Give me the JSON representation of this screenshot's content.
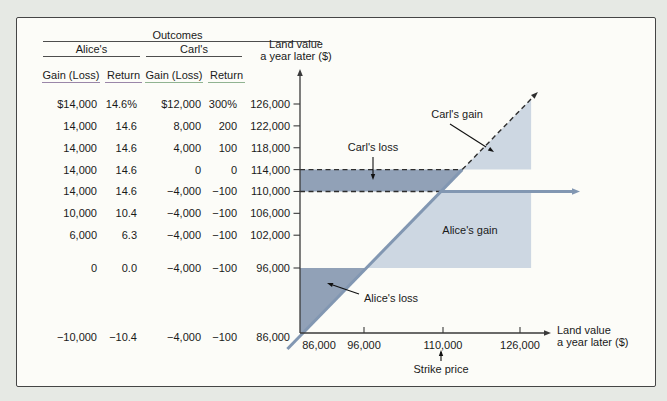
{
  "table": {
    "title": "Outcomes",
    "group_headers": [
      "Alice's",
      "Carl's"
    ],
    "columns": [
      "Gain (Loss)",
      "Return",
      "Gain (Loss)",
      "Return"
    ],
    "land_value_header": [
      "Land value",
      "a year later ($)"
    ],
    "rows": [
      {
        "land_value": 126000,
        "land_label": "126,000",
        "cells": [
          "$14,000",
          "14.6%",
          "$12,000",
          "300%"
        ]
      },
      {
        "land_value": 122000,
        "land_label": "122,000",
        "cells": [
          "14,000",
          "14.6",
          "8,000",
          "200"
        ]
      },
      {
        "land_value": 118000,
        "land_label": "118,000",
        "cells": [
          "14,000",
          "14.6",
          "4,000",
          "100"
        ]
      },
      {
        "land_value": 114000,
        "land_label": "114,000",
        "cells": [
          "14,000",
          "14.6",
          "0",
          "0"
        ]
      },
      {
        "land_value": 110000,
        "land_label": "110,000",
        "cells": [
          "14,000",
          "14.6",
          "−4,000",
          "−100"
        ]
      },
      {
        "land_value": 106000,
        "land_label": "106,000",
        "cells": [
          "10,000",
          "10.4",
          "−4,000",
          "−100"
        ]
      },
      {
        "land_value": 102000,
        "land_label": "102,000",
        "cells": [
          "6,000",
          "6.3",
          "−4,000",
          "−100"
        ]
      },
      {
        "land_value": 96000,
        "land_label": "96,000",
        "cells": [
          "0",
          "0.0",
          "−4,000",
          "−100"
        ]
      },
      {
        "land_value": 86000,
        "land_label": "86,000",
        "cells": [
          "−10,000",
          "−10.4",
          "−4,000",
          "−100"
        ]
      }
    ]
  },
  "chart_data": {
    "type": "area",
    "title": "",
    "xlabel": "Land value a year later ($)",
    "ylabel": "Land value a year later ($)",
    "xlabel_lines": [
      "Land value",
      "a year later ($)"
    ],
    "x_ticks": [
      86000,
      96000,
      110000,
      126000
    ],
    "x_tick_labels": [
      "86,000",
      "96,000",
      "110,000",
      "126,000"
    ],
    "y_ticks": [
      126000,
      122000,
      118000,
      114000,
      110000,
      106000,
      102000,
      96000,
      86000
    ],
    "x_range": [
      86000,
      130000
    ],
    "y_range": [
      86000,
      130000
    ],
    "strike_price": 110000,
    "purchase_price": 96000,
    "upper_dashed_level": 114000,
    "lower_dashed_level": 110000,
    "region_right_edge": 128300,
    "diagonal_line": {
      "slope": 1,
      "description": "45-degree line: land value a year later equals itself"
    },
    "horizontal_payoff_level": 110000,
    "regions": [
      {
        "label": "Carl's loss",
        "shade": "dark",
        "between_y": [
          110000,
          114000
        ],
        "side": "left-of-diagonal"
      },
      {
        "label": "Carl's gain",
        "shade": "light",
        "above_y": 114000,
        "side": "right-of-diagonal"
      },
      {
        "label": "Alice's gain",
        "shade": "light",
        "between_y": [
          96000,
          110000
        ],
        "side": "right-of-diagonal"
      },
      {
        "label": "Alice's loss",
        "shade": "dark",
        "below_y": 96000,
        "side": "left-of-diagonal"
      }
    ],
    "annotations": [
      "Carl's gain",
      "Carl's loss",
      "Alice's gain",
      "Alice's loss",
      "Strike price"
    ]
  },
  "colors": {
    "dark_region": "#91a1b7",
    "light_region": "#cdd7e2",
    "payoff_line": "#8297b2",
    "dashed_line": "#2e2e2e",
    "axis": "#3a3a3a",
    "text": "#1a1a1a",
    "page_bg": "#e6e9e4",
    "panel_bg": "#fcfcf8",
    "panel_border": "#454545",
    "alice_header_underline": "#9a86a8",
    "carl_header_underline": "#90b391"
  }
}
